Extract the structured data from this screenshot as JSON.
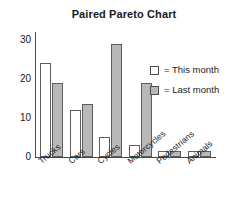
{
  "chart_data": {
    "type": "bar",
    "title": "Paired Pareto Chart",
    "xlabel": "",
    "ylabel": "",
    "ylim": [
      0,
      32
    ],
    "yticks": [
      0,
      10,
      20,
      30
    ],
    "ytick_labels": [
      "0",
      "10",
      "20",
      "30"
    ],
    "grid": false,
    "legend_position": "right",
    "categories": [
      "Trucks",
      "Cars",
      "Cycles",
      "Motorcycles",
      "Pedestrians",
      "Animals"
    ],
    "series": [
      {
        "name": "This month",
        "legend_label": "= This month",
        "color": "#ffffff",
        "border_color": "#5d5d5d",
        "values": [
          24,
          12,
          5,
          3,
          1.5,
          1.5
        ]
      },
      {
        "name": "Last month",
        "legend_label": "= Last month",
        "color": "#b9b9b9",
        "border_color": "#5d5d5d",
        "values": [
          19,
          13.5,
          29,
          19,
          1.5,
          1.5
        ]
      }
    ]
  },
  "colors": {
    "this_month_fill": "#ffffff",
    "last_month_fill": "#b9b9b9",
    "bar_border": "#5d5d5d",
    "axis": "#4a4a4a",
    "text": "#1a1a1a",
    "background": "#ffffff"
  }
}
